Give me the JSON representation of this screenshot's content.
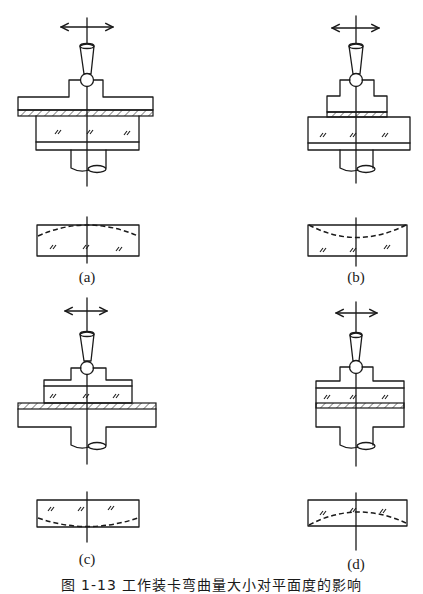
{
  "figure": {
    "caption": "图 1-13  工作装卡弯曲量大小对平面度的影响",
    "panels": [
      {
        "id": "a",
        "label": "(a)",
        "setup": "wide clamp plate above hatched layer above glass workpiece",
        "result_curve": "convex-down dashed (edges lower)"
      },
      {
        "id": "b",
        "label": "(b)",
        "setup": "narrow block above hatched layer above wide glass workpiece",
        "result_curve": "concave dashed (center lower)"
      },
      {
        "id": "c",
        "label": "(c)",
        "setup": "glass workpiece above hatched layer above wide base",
        "result_curve": "concave-up dashed at bottom"
      },
      {
        "id": "d",
        "label": "(d)",
        "setup": "glass workpiece between block and hatched layer on base",
        "result_curve": "arched dashed (center higher)"
      }
    ],
    "symbols": {
      "motion_arrow": "double-headed-arrow",
      "glass_mark": "//",
      "tool": "tapered-spindle-with-ball"
    },
    "colors": {
      "ink": "#1a1a1a",
      "background": "#ffffff"
    }
  }
}
